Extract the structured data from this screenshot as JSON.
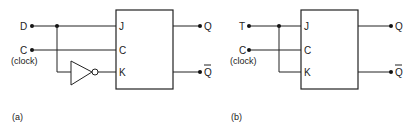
{
  "diagram_a": {
    "caption": "(a)",
    "inputs": {
      "data": "D",
      "clock": "C",
      "clock_note": "(clock)"
    },
    "pins": {
      "j": "J",
      "c": "C",
      "k": "K"
    },
    "outputs": {
      "q": "Q",
      "q_bar": "Q"
    },
    "gate": "inverter"
  },
  "diagram_b": {
    "caption": "(b)",
    "inputs": {
      "toggle": "T",
      "clock": "C",
      "clock_note": "(clock)"
    },
    "pins": {
      "j": "J",
      "c": "C",
      "k": "K"
    },
    "outputs": {
      "q": "Q",
      "q_bar": "Q"
    }
  },
  "colors": {
    "line": "#222222",
    "background": "#ffffff"
  }
}
